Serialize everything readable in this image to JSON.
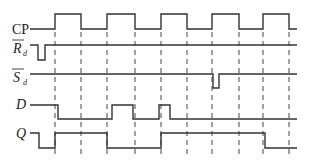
{
  "diagram": {
    "type": "timing-diagram",
    "signals": [
      {
        "name": "CP",
        "label": "CP",
        "overbar": false,
        "italic": false
      },
      {
        "name": "Rd",
        "label": "R",
        "subscript": "d",
        "overbar": true,
        "italic": true
      },
      {
        "name": "Sd",
        "label": "S",
        "subscript": "d",
        "overbar": true,
        "italic": true
      },
      {
        "name": "D",
        "label": "D",
        "overbar": false,
        "italic": true
      },
      {
        "name": "Q",
        "label": "Q",
        "overbar": false,
        "italic": true
      }
    ],
    "clock_edges_x": [
      55,
      81,
      107,
      135,
      161,
      187,
      212,
      239,
      263,
      289
    ],
    "line_color": "#333333"
  }
}
